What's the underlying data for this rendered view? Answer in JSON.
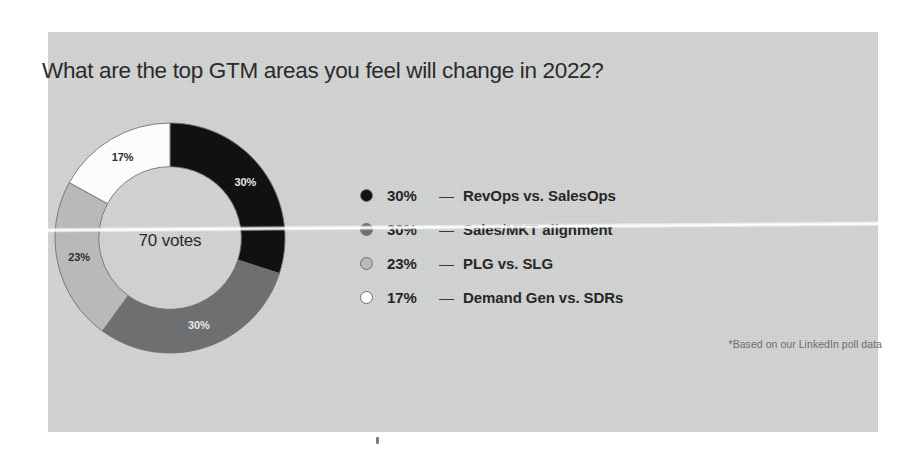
{
  "title": "What are the top GTM areas you feel will change in 2022?",
  "footnote": "*Based on our LinkedIn poll data",
  "center": {
    "total_label": "70 votes"
  },
  "legend": {
    "dash": "—",
    "rows": [
      {
        "pct": "30%",
        "label": "RevOps vs. SalesOps",
        "color": "#111111"
      },
      {
        "pct": "30%",
        "label": "Sales/MKT alignment",
        "color": "#6e6f70"
      },
      {
        "pct": "23%",
        "label": "PLG vs. SLG",
        "color": "#b8b9b9"
      },
      {
        "pct": "17%",
        "label": "Demand Gen vs. SDRs",
        "color": "#fbfbfb"
      }
    ]
  },
  "chart_data": {
    "type": "pie",
    "variant": "donut",
    "title": "What are the top GTM areas you feel will change in 2022?",
    "total_votes": 70,
    "total_label": "70 votes",
    "units": "percent",
    "start_angle_deg": 0,
    "direction": "clockwise",
    "inner_radius_ratio": 0.62,
    "legend_position": "right",
    "grid": false,
    "categories": [
      "RevOps vs. SalesOps",
      "Sales/MKT alignment",
      "PLG vs. SLG",
      "Demand Gen vs. SDRs"
    ],
    "values": [
      30,
      30,
      23,
      17
    ],
    "labels": [
      "30%",
      "30%",
      "23%",
      "17%"
    ],
    "colors": [
      "#111111",
      "#6e6f70",
      "#b8b9b9",
      "#fbfbfb"
    ],
    "slices": [
      {
        "name": "RevOps vs. SalesOps",
        "value": 30,
        "label": "30%",
        "color": "#111111",
        "label_color": "light"
      },
      {
        "name": "Sales/MKT alignment",
        "value": 30,
        "label": "30%",
        "color": "#6e6f70",
        "label_color": "light"
      },
      {
        "name": "PLG vs. SLG",
        "value": 23,
        "label": "23%",
        "color": "#b8b9b9",
        "label_color": "dark"
      },
      {
        "name": "Demand Gen vs. SDRs",
        "value": 17,
        "label": "17%",
        "color": "#fbfbfb",
        "label_color": "dark"
      }
    ],
    "annotations": [
      "*Based on our LinkedIn poll data"
    ]
  },
  "palette": {
    "page_background": "#ffffff",
    "card_background": "#d2d3d3",
    "title_text": "#2b2b2b",
    "body_text": "#262626",
    "footnote_text": "#6c6d6e",
    "slice_stroke": "#6f7071"
  }
}
